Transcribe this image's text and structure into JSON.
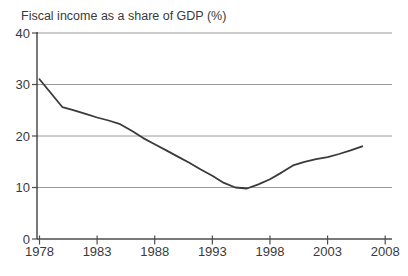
{
  "chart_data": {
    "type": "line",
    "title": "Fiscal income as a share of GDP (%)",
    "xlabel": "",
    "ylabel": "",
    "x": [
      1978,
      1979,
      1980,
      1981,
      1982,
      1983,
      1984,
      1985,
      1986,
      1987,
      1988,
      1989,
      1990,
      1991,
      1992,
      1993,
      1994,
      1995,
      1996,
      1997,
      1998,
      1999,
      2000,
      2001,
      2002,
      2003,
      2004,
      2005,
      2006
    ],
    "series": [
      {
        "name": "Fiscal income as a share of GDP",
        "values": [
          31.0,
          28.3,
          25.6,
          25.0,
          24.3,
          23.6,
          23.0,
          22.3,
          21.0,
          19.6,
          18.4,
          17.2,
          16.0,
          14.8,
          13.5,
          12.3,
          10.9,
          10.0,
          9.8,
          10.6,
          11.6,
          12.9,
          14.3,
          15.0,
          15.5,
          15.9,
          16.5,
          17.2,
          18.0
        ]
      }
    ],
    "xlim": [
      1978,
      2008.6
    ],
    "ylim": [
      0,
      40
    ],
    "x_ticks": [
      1978,
      1983,
      1988,
      1993,
      1998,
      2003,
      2008
    ],
    "y_ticks": [
      0,
      10,
      20,
      30,
      40
    ],
    "grid": "horizontal",
    "legend_position": "none",
    "colors": {
      "line": "#3a3a3a",
      "grid": "#9a9a9a",
      "axis": "#4d4d4d",
      "text": "#3a3a3a",
      "background": "#ffffff"
    }
  }
}
